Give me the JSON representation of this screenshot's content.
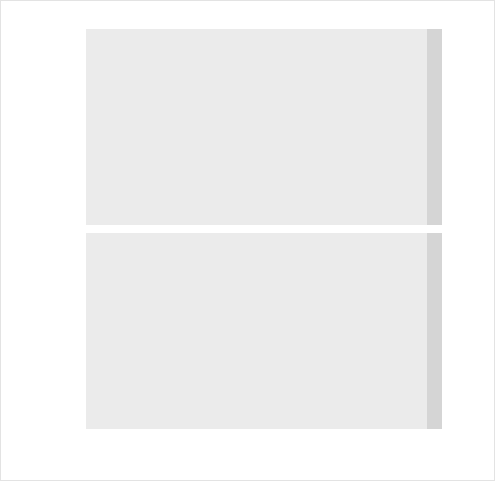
{
  "figure": {
    "background_color": "#ffffff",
    "panel_color": "#ebebeb",
    "strip_color": "#d5d5d5",
    "line_color": "#3c3c3c",
    "grid_color": "#ffffff"
  },
  "axes": {
    "ylabel": "value",
    "xlabel": "Number of topics"
  },
  "facets": {
    "top_label": "coherence",
    "bottom_label": "perplexity"
  },
  "chart_data": [
    {
      "type": "line",
      "title": "",
      "facet": "coherence",
      "xlabel": "Number of topics",
      "ylabel": "value",
      "x": [
        5,
        10,
        15,
        20,
        25,
        30
      ],
      "values": [
        -122.4,
        -131.7,
        -131.2,
        -133.4,
        -136.1,
        -138.1
      ],
      "xlim": [
        3.5,
        31.5
      ],
      "ylim": [
        -139.2,
        -121.6
      ],
      "xticks": [
        10,
        20,
        30
      ],
      "xticklabels": [
        "10",
        "20",
        "30"
      ],
      "yticks": [
        -125,
        -130,
        -135
      ],
      "yticklabels": [
        "-125",
        "-130",
        "-135"
      ],
      "grid": true,
      "legend": "none"
    },
    {
      "type": "line",
      "title": "",
      "facet": "perplexity",
      "xlabel": "Number of topics",
      "ylabel": "value",
      "x": [
        5,
        10,
        15,
        20,
        25,
        30
      ],
      "values": [
        404,
        373,
        341,
        306,
        293,
        272
      ],
      "xlim": [
        3.5,
        31.5
      ],
      "ylim": [
        267,
        409
      ],
      "xticks": [
        10,
        20,
        30
      ],
      "xticklabels": [
        "10",
        "20",
        "30"
      ],
      "yticks": [
        400,
        350,
        300
      ],
      "yticklabels": [
        "400",
        "350",
        "300"
      ],
      "grid": true,
      "legend": "none"
    }
  ]
}
